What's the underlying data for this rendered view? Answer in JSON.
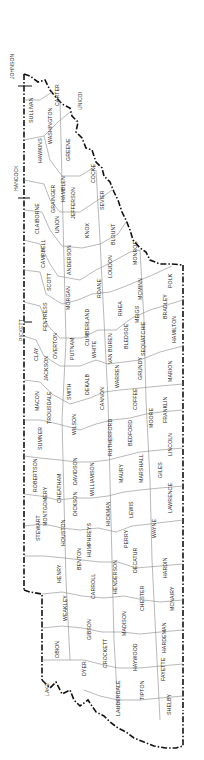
{
  "map": {
    "title": "Tennessee Counties",
    "orientation": "rotated 90deg counter-clockwise",
    "border_color": "#111111",
    "county_line_color": "#888888",
    "background": "#ffffff"
  },
  "bordering_labels": [
    {
      "name": "JOHNSON",
      "x": 10,
      "y": 68
    },
    {
      "name": "HANCOCK",
      "x": 14,
      "y": 180
    },
    {
      "name": "PICKETT",
      "x": 19,
      "y": 330
    },
    {
      "name": "UNICOI",
      "x": 78,
      "y": 100
    },
    {
      "name": "LAKE",
      "x": 45,
      "y": 690
    }
  ],
  "counties": [
    {
      "name": "SULLIVAN",
      "x": 29,
      "y": 110
    },
    {
      "name": "CARTER",
      "x": 55,
      "y": 96
    },
    {
      "name": "WASHINGTON",
      "x": 48,
      "y": 128
    },
    {
      "name": "HAWKINS",
      "x": 38,
      "y": 152
    },
    {
      "name": "GREENE",
      "x": 66,
      "y": 151
    },
    {
      "name": "COCKE",
      "x": 91,
      "y": 175
    },
    {
      "name": "HAMBLEN",
      "x": 61,
      "y": 191
    },
    {
      "name": "GRAINGER",
      "x": 51,
      "y": 200
    },
    {
      "name": "JEFFERSON",
      "x": 71,
      "y": 205
    },
    {
      "name": "SEVIER",
      "x": 100,
      "y": 200
    },
    {
      "name": "CLAIBORNE",
      "x": 35,
      "y": 220
    },
    {
      "name": "UNION",
      "x": 55,
      "y": 225
    },
    {
      "name": "KNOX",
      "x": 85,
      "y": 232
    },
    {
      "name": "BLOUNT",
      "x": 111,
      "y": 235
    },
    {
      "name": "CAMPBELL",
      "x": 41,
      "y": 255
    },
    {
      "name": "ANDERSON",
      "x": 67,
      "y": 262
    },
    {
      "name": "LOUDON",
      "x": 108,
      "y": 268
    },
    {
      "name": "MONROE",
      "x": 133,
      "y": 255
    },
    {
      "name": "SCOTT",
      "x": 47,
      "y": 283
    },
    {
      "name": "MORGAN",
      "x": 66,
      "y": 300
    },
    {
      "name": "ROANE",
      "x": 97,
      "y": 290
    },
    {
      "name": "MCMINN",
      "x": 138,
      "y": 290
    },
    {
      "name": "POLK",
      "x": 168,
      "y": 282
    },
    {
      "name": "FENTRESS",
      "x": 43,
      "y": 318
    },
    {
      "name": "CUMBERLAND",
      "x": 85,
      "y": 330
    },
    {
      "name": "RHEA",
      "x": 118,
      "y": 310
    },
    {
      "name": "MEIGS",
      "x": 135,
      "y": 315
    },
    {
      "name": "BRADLEY",
      "x": 163,
      "y": 308
    },
    {
      "name": "OVERTON",
      "x": 53,
      "y": 348
    },
    {
      "name": "CLAY",
      "x": 34,
      "y": 355
    },
    {
      "name": "JACKSON",
      "x": 44,
      "y": 370
    },
    {
      "name": "PUTNAM",
      "x": 70,
      "y": 350
    },
    {
      "name": "WHITE",
      "x": 92,
      "y": 350
    },
    {
      "name": "VAN BUREN",
      "x": 108,
      "y": 350
    },
    {
      "name": "BLEDSOE",
      "x": 124,
      "y": 338
    },
    {
      "name": "SEQUATCHIE",
      "x": 141,
      "y": 340
    },
    {
      "name": "HAMILTON",
      "x": 172,
      "y": 330
    },
    {
      "name": "MACON",
      "x": 35,
      "y": 403
    },
    {
      "name": "TROUSDALE",
      "x": 47,
      "y": 410
    },
    {
      "name": "SMITH",
      "x": 67,
      "y": 392
    },
    {
      "name": "DEKALB",
      "x": 85,
      "y": 385
    },
    {
      "name": "WARREN",
      "x": 115,
      "y": 378
    },
    {
      "name": "GRUNDY",
      "x": 138,
      "y": 370
    },
    {
      "name": "MARION",
      "x": 168,
      "y": 372
    },
    {
      "name": "CANNON",
      "x": 100,
      "y": 400
    },
    {
      "name": "COFFEE",
      "x": 133,
      "y": 400
    },
    {
      "name": "FRANKLIN",
      "x": 163,
      "y": 410
    },
    {
      "name": "SUMNER",
      "x": 38,
      "y": 440
    },
    {
      "name": "WILSON",
      "x": 72,
      "y": 425
    },
    {
      "name": "RUTHERFORD",
      "x": 108,
      "y": 440
    },
    {
      "name": "BEDFORD",
      "x": 128,
      "y": 435
    },
    {
      "name": "MOORE",
      "x": 149,
      "y": 420
    },
    {
      "name": "LINCOLN",
      "x": 168,
      "y": 445
    },
    {
      "name": "ROBERTSON",
      "x": 33,
      "y": 478
    },
    {
      "name": "DAVIDSON",
      "x": 73,
      "y": 472
    },
    {
      "name": "WILLIAMSON",
      "x": 90,
      "y": 480
    },
    {
      "name": "MARSHALL",
      "x": 139,
      "y": 470
    },
    {
      "name": "MAURY",
      "x": 119,
      "y": 475
    },
    {
      "name": "GILES",
      "x": 158,
      "y": 470
    },
    {
      "name": "MONTGOMERY",
      "x": 43,
      "y": 510
    },
    {
      "name": "CHEATHAM",
      "x": 57,
      "y": 490
    },
    {
      "name": "DICKSON",
      "x": 73,
      "y": 505
    },
    {
      "name": "HICKMAN",
      "x": 106,
      "y": 515
    },
    {
      "name": "LEWIS",
      "x": 129,
      "y": 510
    },
    {
      "name": "LAWRENCE",
      "x": 168,
      "y": 500
    },
    {
      "name": "STEWART",
      "x": 36,
      "y": 530
    },
    {
      "name": "HOUSTON",
      "x": 61,
      "y": 535
    },
    {
      "name": "HUMPHREYS",
      "x": 87,
      "y": 543
    },
    {
      "name": "PERRY",
      "x": 124,
      "y": 540
    },
    {
      "name": "WAYNE",
      "x": 152,
      "y": 530
    },
    {
      "name": "BENTON",
      "x": 77,
      "y": 560
    },
    {
      "name": "DECATUR",
      "x": 133,
      "y": 562
    },
    {
      "name": "HENRY",
      "x": 57,
      "y": 575
    },
    {
      "name": "CARROLL",
      "x": 91,
      "y": 588
    },
    {
      "name": "HENDERSON",
      "x": 113,
      "y": 580
    },
    {
      "name": "HARDIN",
      "x": 163,
      "y": 568
    },
    {
      "name": "CHESTER",
      "x": 140,
      "y": 600
    },
    {
      "name": "MCNAIRY",
      "x": 170,
      "y": 600
    },
    {
      "name": "WEAKLEY",
      "x": 63,
      "y": 610
    },
    {
      "name": "GIBSON",
      "x": 87,
      "y": 630
    },
    {
      "name": "MADISON",
      "x": 122,
      "y": 625
    },
    {
      "name": "OBION",
      "x": 55,
      "y": 650
    },
    {
      "name": "CROCKETT",
      "x": 103,
      "y": 655
    },
    {
      "name": "HAYWOOD",
      "x": 133,
      "y": 660
    },
    {
      "name": "HARDEMAN",
      "x": 162,
      "y": 640
    },
    {
      "name": "DYER",
      "x": 82,
      "y": 670
    },
    {
      "name": "LAUDERDALE",
      "x": 116,
      "y": 700
    },
    {
      "name": "FAYETTE",
      "x": 161,
      "y": 670
    },
    {
      "name": "TIPTON",
      "x": 140,
      "y": 690
    },
    {
      "name": "SHELBY",
      "x": 167,
      "y": 705
    }
  ]
}
